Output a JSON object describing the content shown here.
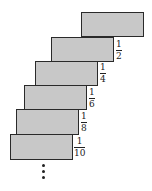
{
  "diagram": {
    "block_fill": "#c8c8c8",
    "block_border": "#2a2a2a",
    "blocks": [
      {
        "x": 81,
        "y": 12,
        "w": 63,
        "h": 25
      },
      {
        "x": 51,
        "y": 37,
        "w": 63,
        "h": 25,
        "label_num": "1",
        "label_den": "2"
      },
      {
        "x": 35,
        "y": 61,
        "w": 63,
        "h": 25,
        "label_num": "1",
        "label_den": "4"
      },
      {
        "x": 24,
        "y": 85,
        "w": 63,
        "h": 25,
        "label_num": "1",
        "label_den": "6"
      },
      {
        "x": 16,
        "y": 109,
        "w": 63,
        "h": 26,
        "label_num": "1",
        "label_den": "8"
      },
      {
        "x": 10,
        "y": 134,
        "w": 63,
        "h": 26,
        "label_num": "1",
        "label_den": "10"
      }
    ],
    "continuation": "vertical-ellipsis"
  }
}
